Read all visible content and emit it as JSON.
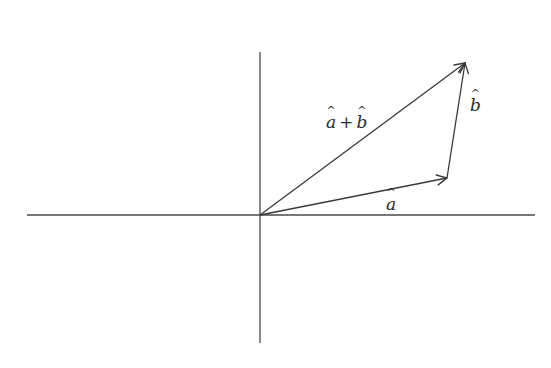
{
  "diagram": {
    "type": "vector-addition",
    "colors": {
      "line": "#3a3a3a",
      "background": "#ffffff"
    },
    "axes": {
      "horizontal": {
        "x1": 27,
        "y1": 215,
        "x2": 535,
        "y2": 215
      },
      "vertical": {
        "x1": 260,
        "y1": 52,
        "x2": 260,
        "y2": 343
      }
    },
    "origin": {
      "x": 260,
      "y": 215
    },
    "vectors": [
      {
        "id": "a",
        "from": [
          260,
          215
        ],
        "to": [
          447,
          178
        ],
        "label": "a",
        "label_full": "â"
      },
      {
        "id": "b",
        "from": [
          447,
          178
        ],
        "to": [
          465,
          63
        ],
        "label": "b",
        "label_full": "b̂"
      },
      {
        "id": "sum",
        "from": [
          260,
          215
        ],
        "to": [
          465,
          63
        ],
        "label_a": "a",
        "label_plus": "+",
        "label_b": "b",
        "label_full": "â + b̂"
      }
    ],
    "labels": {
      "a": {
        "text": "a",
        "x": 386,
        "y": 196
      },
      "b": {
        "text": "b",
        "x": 470,
        "y": 98
      },
      "sum": {
        "x": 326,
        "y": 114
      }
    }
  }
}
